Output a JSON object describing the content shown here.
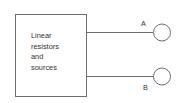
{
  "diagram": {
    "type": "circuit-block",
    "block": {
      "label_lines": [
        "Linear",
        "resistors",
        "and",
        "sources"
      ]
    },
    "terminals": [
      {
        "label": "A"
      },
      {
        "label": "B"
      }
    ],
    "colors": {
      "stroke": "#6e6e6e",
      "text": "#333333",
      "background": "#ffffff"
    }
  }
}
